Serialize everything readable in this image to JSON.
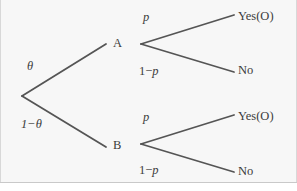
{
  "figure": {
    "type": "decision-tree",
    "background_color": "#f7f7f7",
    "line_color": "#555555",
    "text_color": "#3b3b3b"
  },
  "nodes": {
    "root": {
      "label": "",
      "x": 22,
      "y": 96
    },
    "a": {
      "label": "A",
      "x": 115,
      "y": 43
    },
    "b": {
      "label": "B",
      "x": 115,
      "y": 145
    },
    "a_split": {
      "x": 141,
      "y": 44
    },
    "b_split": {
      "x": 141,
      "y": 144
    }
  },
  "branch_labels": {
    "theta": "θ",
    "one_minus_theta": "1−θ",
    "p_top": "p",
    "one_minus_p_top_prefix": "1−",
    "one_minus_p_top_var": "p",
    "p_bottom": "p",
    "one_minus_p_bottom_prefix": "1−",
    "one_minus_p_bottom_var": "p"
  },
  "outcomes": {
    "yes_top": "Yes(O)",
    "no_top": "No",
    "yes_bottom": "Yes(O)",
    "no_bottom": "No"
  },
  "edges": [
    {
      "name": "root-to-a",
      "x1": 22,
      "y1": 96,
      "x2": 106,
      "y2": 44
    },
    {
      "name": "root-to-b",
      "x1": 22,
      "y1": 96,
      "x2": 106,
      "y2": 147
    },
    {
      "name": "a-to-yes",
      "x1": 141,
      "y1": 44,
      "x2": 234,
      "y2": 15
    },
    {
      "name": "a-to-no",
      "x1": 141,
      "y1": 44,
      "x2": 234,
      "y2": 72
    },
    {
      "name": "b-to-yes",
      "x1": 141,
      "y1": 144,
      "x2": 234,
      "y2": 115
    },
    {
      "name": "b-to-no",
      "x1": 141,
      "y1": 144,
      "x2": 234,
      "y2": 172
    }
  ]
}
